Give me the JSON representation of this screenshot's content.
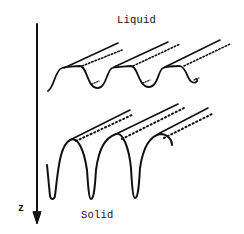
{
  "diagram": {
    "type": "schematic",
    "labels": {
      "top": "Liquid",
      "bottom": "Solid",
      "axis": "z"
    },
    "axis": {
      "direction": "down",
      "description": "vertical arrow pointing downward along growth direction"
    },
    "rows": [
      {
        "name": "liquid-interface",
        "description": "shallow sinusoidal ridges receding in perspective, with dotted solute hatching along ridges",
        "cell_count": 3
      },
      {
        "name": "solid-interface",
        "description": "deep narrow grooves (cusped cells) receding in perspective, with tick hatching along ridges",
        "cell_count": 3
      }
    ],
    "colors": {
      "ink": "#111111",
      "background": "#ffffff"
    }
  }
}
